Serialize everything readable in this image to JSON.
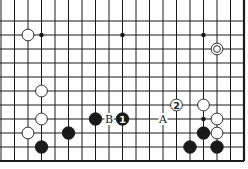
{
  "diagram": {
    "type": "go-board-fragment",
    "edges": {
      "right": true,
      "bottom": true,
      "top": false,
      "left": false
    },
    "colors": {
      "line": "#1a1a1a",
      "black_stone": "#1a1a1a",
      "white_stone": "#ffffff",
      "background": "#ffffff"
    },
    "grid": {
      "columns_x": [
        1,
        14.5,
        28,
        41.5,
        55,
        68.5,
        82,
        95.5,
        109,
        122.5,
        136,
        149.5,
        163,
        176.5,
        190,
        203.5,
        217,
        230.5,
        244
      ],
      "rows_y": [
        21,
        35,
        49,
        63,
        77,
        91,
        105,
        119,
        133,
        147,
        161
      ]
    },
    "hoshi": [
      {
        "col": 3,
        "row": 1
      },
      {
        "col": 9,
        "row": 1
      },
      {
        "col": 15,
        "row": 1
      },
      {
        "col": 15,
        "row": 7
      }
    ],
    "stones": [
      {
        "color": "white",
        "col": 2,
        "row": 1,
        "label": ""
      },
      {
        "color": "white",
        "col": 16,
        "row": 2,
        "label": "",
        "marked": "circle"
      },
      {
        "color": "white",
        "col": 3,
        "row": 5,
        "label": ""
      },
      {
        "color": "white",
        "col": 3,
        "row": 7,
        "label": ""
      },
      {
        "color": "white",
        "col": 2,
        "row": 8,
        "label": ""
      },
      {
        "color": "black",
        "col": 3,
        "row": 9,
        "label": ""
      },
      {
        "color": "black",
        "col": 5,
        "row": 8,
        "label": ""
      },
      {
        "color": "black",
        "col": 7,
        "row": 7,
        "label": ""
      },
      {
        "color": "black",
        "col": 9,
        "row": 7,
        "label": "1"
      },
      {
        "color": "white",
        "col": 13,
        "row": 6,
        "label": "2"
      },
      {
        "color": "white",
        "col": 15,
        "row": 6,
        "label": ""
      },
      {
        "color": "white",
        "col": 16,
        "row": 7,
        "label": ""
      },
      {
        "color": "black",
        "col": 15,
        "row": 8,
        "label": ""
      },
      {
        "color": "white",
        "col": 16,
        "row": 8,
        "label": ""
      },
      {
        "color": "black",
        "col": 14,
        "row": 9,
        "label": ""
      },
      {
        "color": "black",
        "col": 16,
        "row": 9,
        "label": ""
      }
    ],
    "letters": [
      {
        "text": "B",
        "col": 8,
        "row": 7
      },
      {
        "text": "A",
        "col": 12,
        "row": 7
      }
    ]
  }
}
